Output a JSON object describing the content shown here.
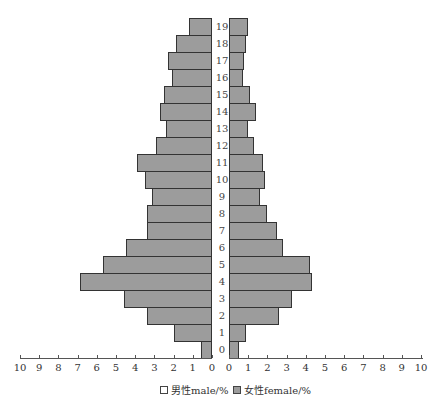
{
  "chart_data": {
    "type": "bar",
    "subtype": "population-pyramid",
    "title": "",
    "categories": [
      "0",
      "1",
      "2",
      "3",
      "4",
      "5",
      "6",
      "7",
      "8",
      "9",
      "10",
      "11",
      "12",
      "13",
      "14",
      "15",
      "16",
      "17",
      "18",
      "19"
    ],
    "series": [
      {
        "name": "男性male/%",
        "side": "left",
        "values": [
          0.55,
          2.0,
          3.4,
          4.6,
          6.9,
          5.7,
          4.5,
          3.4,
          3.4,
          3.1,
          3.5,
          3.9,
          2.9,
          2.4,
          2.7,
          2.5,
          2.1,
          2.3,
          1.9,
          1.2
        ]
      },
      {
        "name": "女性female/%",
        "side": "right",
        "values": [
          0.5,
          0.9,
          2.6,
          3.3,
          4.3,
          4.2,
          2.8,
          2.5,
          2.0,
          1.6,
          1.85,
          1.75,
          1.3,
          1.0,
          1.4,
          1.1,
          0.75,
          0.8,
          0.9,
          1.0
        ]
      }
    ],
    "xlabel": "",
    "ylabel": "",
    "xlim_left": [
      10,
      0
    ],
    "xlim_right": [
      0,
      10
    ],
    "x_ticks_left": [
      "10",
      "9",
      "8",
      "7",
      "6",
      "5",
      "4",
      "3",
      "2",
      "1",
      "0"
    ],
    "x_ticks_right": [
      "0",
      "1",
      "2",
      "3",
      "4",
      "5",
      "6",
      "7",
      "8",
      "9",
      "10"
    ],
    "legend_position": "bottom",
    "grid": false
  },
  "colors": {
    "bar_fill": "#9c9c9c",
    "bar_border": "#333333"
  },
  "legend": {
    "male": "男性male/%",
    "female": "女性female/%"
  }
}
